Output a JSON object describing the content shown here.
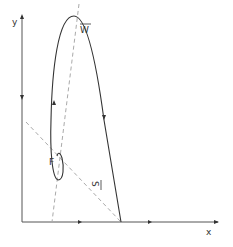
{
  "diagram": {
    "axes": {
      "y_label": "y",
      "x_label": "x"
    },
    "labels": {
      "w_bar": "W",
      "s_bar": "S",
      "f": "F"
    },
    "colors": {
      "curve": "#333333",
      "axis": "#444444",
      "dashed": "#aaaaaa"
    }
  }
}
